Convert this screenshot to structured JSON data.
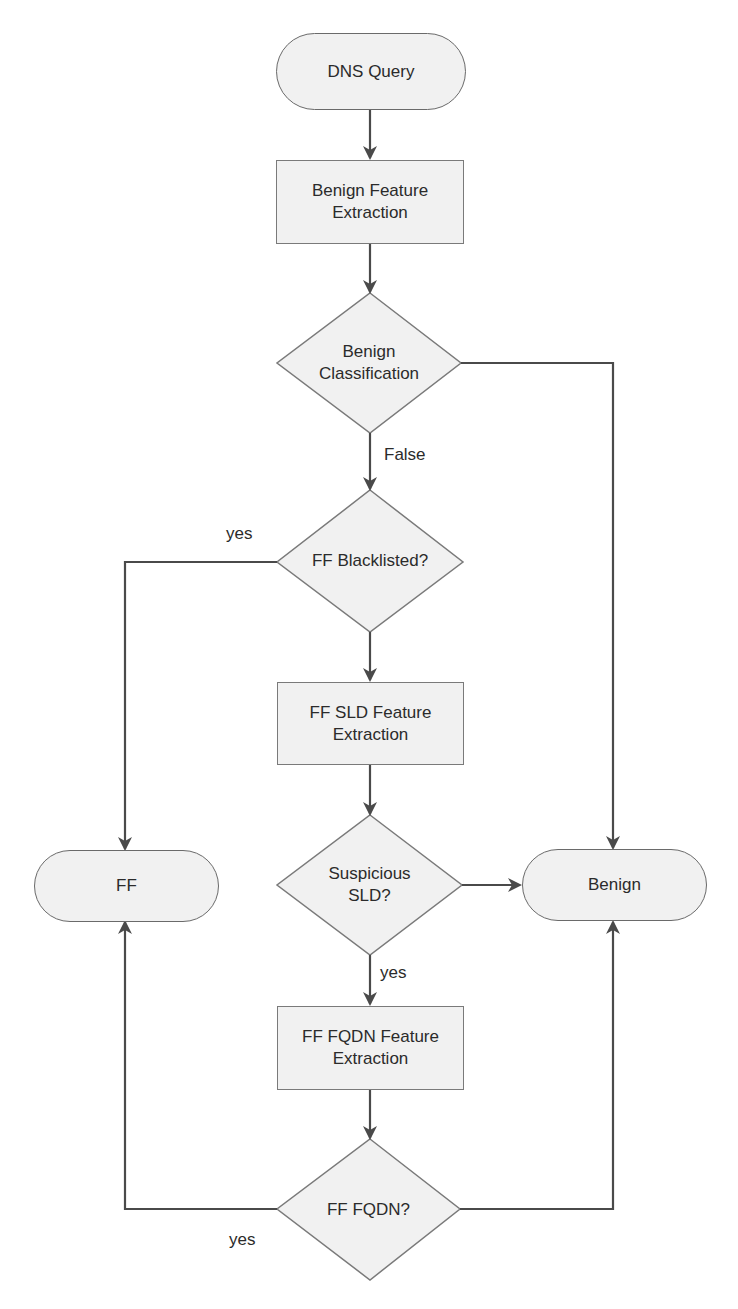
{
  "diagram": {
    "type": "flowchart",
    "colors": {
      "stroke": "#4a4a4a",
      "fill": "#f1f1f1",
      "text": "#2b2b2b"
    },
    "nodes": {
      "dns_query": {
        "label": "DNS Query",
        "shape": "terminal"
      },
      "benign_feature_extraction": {
        "label": "Benign Feature\nExtraction",
        "shape": "process"
      },
      "benign_classification": {
        "label": "Benign\nClassification",
        "shape": "decision"
      },
      "ff_blacklisted": {
        "label": "FF Blacklisted?",
        "shape": "decision"
      },
      "ff_sld_feature_extraction": {
        "label": "FF SLD Feature\nExtraction",
        "shape": "process"
      },
      "suspicious_sld": {
        "label": "Suspicious\nSLD?",
        "shape": "decision"
      },
      "ff_fqdn_feature_extraction": {
        "label": "FF FQDN Feature\nExtraction",
        "shape": "process"
      },
      "ff_fqdn": {
        "label": "FF FQDN?",
        "shape": "decision"
      },
      "ff": {
        "label": "FF",
        "shape": "terminal"
      },
      "benign": {
        "label": "Benign",
        "shape": "terminal"
      }
    },
    "edge_labels": {
      "false": "False",
      "yes_blacklisted": "yes",
      "yes_sld": "yes",
      "yes_fqdn": "yes"
    },
    "edges": [
      {
        "from": "dns_query",
        "to": "benign_feature_extraction",
        "label": ""
      },
      {
        "from": "benign_feature_extraction",
        "to": "benign_classification",
        "label": ""
      },
      {
        "from": "benign_classification",
        "to": "ff_blacklisted",
        "label": "False"
      },
      {
        "from": "benign_classification",
        "to": "benign",
        "label": ""
      },
      {
        "from": "ff_blacklisted",
        "to": "ff",
        "label": "yes"
      },
      {
        "from": "ff_blacklisted",
        "to": "ff_sld_feature_extraction",
        "label": ""
      },
      {
        "from": "ff_sld_feature_extraction",
        "to": "suspicious_sld",
        "label": ""
      },
      {
        "from": "suspicious_sld",
        "to": "benign",
        "label": ""
      },
      {
        "from": "suspicious_sld",
        "to": "ff_fqdn_feature_extraction",
        "label": "yes"
      },
      {
        "from": "ff_fqdn_feature_extraction",
        "to": "ff_fqdn",
        "label": ""
      },
      {
        "from": "ff_fqdn",
        "to": "ff",
        "label": "yes"
      },
      {
        "from": "ff_fqdn",
        "to": "benign",
        "label": ""
      }
    ]
  }
}
